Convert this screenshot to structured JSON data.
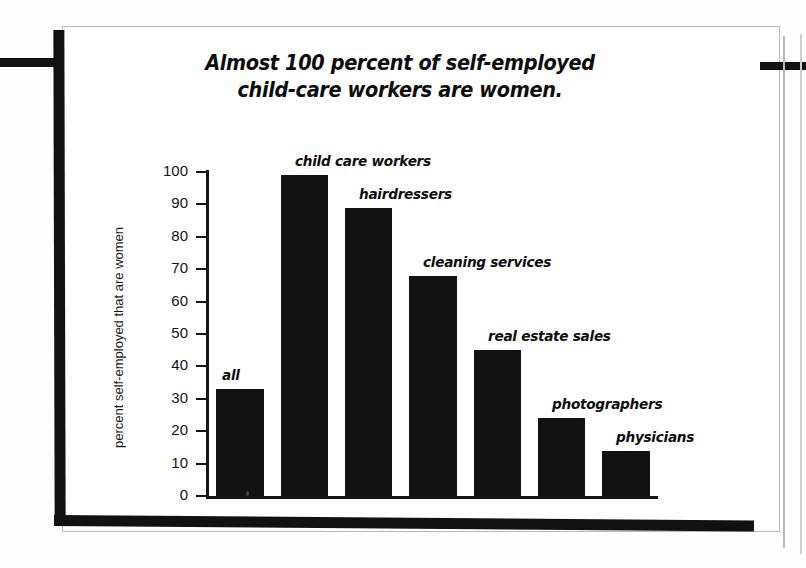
{
  "figure": {
    "title_line1": "Almost 100 percent of self-employed",
    "title_line2": "child-care workers are women.",
    "frame_color": "#111111",
    "bar_color": "#121212",
    "page_color": "#ffffff"
  },
  "chart_data": {
    "type": "bar",
    "title": "Almost 100 percent of self-employed child-care workers are women.",
    "xlabel": "",
    "ylabel": "percent self-employed that are women",
    "ylim": [
      0,
      100
    ],
    "grid": false,
    "legend": "none",
    "categories": [
      "all",
      "child care workers",
      "hairdressers",
      "cleaning services",
      "real estate sales",
      "photographers",
      "physicians"
    ],
    "values": [
      33,
      99,
      89,
      68,
      45,
      24,
      14
    ],
    "yticks": [
      0,
      10,
      20,
      30,
      40,
      50,
      60,
      70,
      80,
      90,
      100
    ],
    "yticklabels": [
      "0",
      "10",
      "20",
      "30",
      "40",
      "50",
      "60",
      "70",
      "80",
      "90",
      "100"
    ]
  }
}
